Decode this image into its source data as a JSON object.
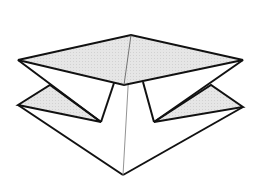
{
  "diagram": {
    "type": "origami-fold-step",
    "colors": {
      "background": "#ffffff",
      "shade": "#e4e4e4",
      "line": "#111111",
      "thin_line": "#777777"
    },
    "shapes": {
      "top_diamond": "18,60 131,35 243,60 124,85",
      "left_lower_flap": "18,105 50,85 101,122",
      "right_lower_flap": "243,107 211,85 154,122",
      "base_body": "18,105 101,122 114,83 124,85 143,82 154,122 243,107 123,175"
    },
    "lines": {
      "left_diagonal": "18,60 101,122",
      "right_diagonal": "243,60 154,122",
      "left_stem": "114,83 101,122",
      "right_stem": "143,82 154,122",
      "left_bottom_edge": "18,105 123,175",
      "right_bottom_edge": "243,107 123,175",
      "left_flap_bottom": "18,105 101,122",
      "right_flap_bottom": "243,107 154,122",
      "center_crease": "131,35 123,175"
    }
  }
}
